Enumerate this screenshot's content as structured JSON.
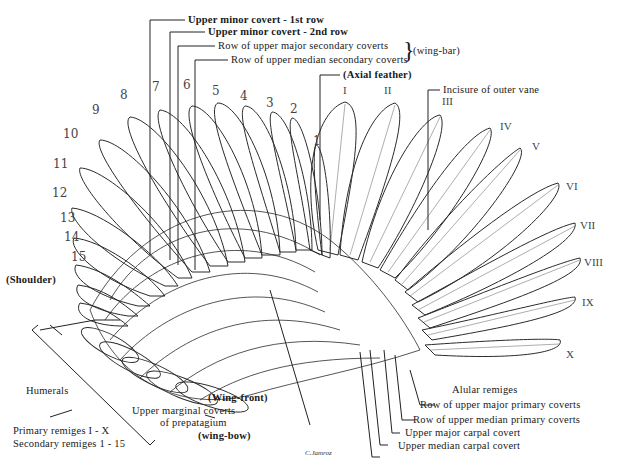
{
  "figure": {
    "signature": "C.Jamroz"
  },
  "secondary_numbers": [
    "1",
    "2",
    "3",
    "4",
    "5",
    "6",
    "7",
    "8",
    "9",
    "10",
    "11",
    "12",
    "13",
    "14",
    "15"
  ],
  "primary_numerals": [
    "I",
    "II",
    "III",
    "IV",
    "V",
    "VI",
    "VII",
    "VIII",
    "IX",
    "X"
  ],
  "labels": {
    "upper_minor_1": "Upper minor covert - 1st row",
    "upper_minor_2": "Upper minor covert - 2nd row",
    "major_secondary": "Row of upper major secondary coverts",
    "median_secondary": "Row of upper median secondary coverts",
    "wing_bar": "(wing-bar)",
    "axial": "(Axial feather)",
    "incisure": "Incisure of outer vane",
    "shoulder": "(Shoulder)",
    "humerals": "Humerals",
    "wing_front": "(Wing-front)",
    "marginal_1": "Upper marginal coverts",
    "marginal_2": "of prepatagium",
    "wing_bow": "(wing-bow)",
    "alular": "Alular remiges",
    "major_primary": "Row of upper major primary coverts",
    "median_primary": "Row of upper median primary coverts",
    "major_carpal": "Upper major carpal covert",
    "median_carpal": "Upper median carpal covert"
  },
  "legend": {
    "primary": "Primary remiges  I - X",
    "secondary": "Secondary remiges  1 - 15"
  }
}
